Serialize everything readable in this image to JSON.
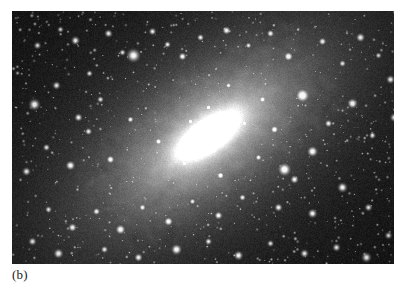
{
  "figure": {
    "caption_label": "(b)",
    "page_background": "#ffffff",
    "plate": {
      "x": 12,
      "y": 11,
      "width": 382,
      "height": 253,
      "background_color": "#0d0d0d",
      "sky_brightness": 22,
      "noise_amplitude": 16,
      "vignette": 0.18
    },
    "galaxy": {
      "name": "spiral-galaxy",
      "center_x": 196,
      "center_y": 124,
      "position_angle_deg": -35,
      "core": {
        "semi_major": 40,
        "semi_minor": 17,
        "peak_brightness": 255,
        "falloff": 2.0
      },
      "disk": {
        "semi_major": 132,
        "semi_minor": 62,
        "peak_brightness": 150,
        "falloff": 1.35
      },
      "halo": {
        "semi_major": 200,
        "semi_minor": 104,
        "peak_brightness": 74,
        "falloff": 1.0
      },
      "mottling_amplitude": 11
    },
    "star_field": {
      "faint_star_count": 900,
      "faint_brightness_range": [
        55,
        150
      ],
      "faint_radius_range": [
        0.6,
        1.5
      ],
      "bright_stars": [
        {
          "x": 25,
          "y": 34,
          "r": 2.2,
          "b": 205
        },
        {
          "x": 22,
          "y": 93,
          "r": 3.4,
          "b": 248
        },
        {
          "x": 48,
          "y": 18,
          "r": 1.9,
          "b": 195
        },
        {
          "x": 63,
          "y": 29,
          "r": 2.6,
          "b": 222
        },
        {
          "x": 77,
          "y": 62,
          "r": 2.0,
          "b": 200
        },
        {
          "x": 96,
          "y": 22,
          "r": 2.4,
          "b": 215
        },
        {
          "x": 110,
          "y": 41,
          "r": 2.0,
          "b": 198
        },
        {
          "x": 121,
          "y": 44,
          "r": 4.3,
          "b": 238
        },
        {
          "x": 140,
          "y": 20,
          "r": 2.3,
          "b": 212
        },
        {
          "x": 155,
          "y": 33,
          "r": 2.1,
          "b": 205
        },
        {
          "x": 170,
          "y": 45,
          "r": 2.5,
          "b": 228
        },
        {
          "x": 188,
          "y": 26,
          "r": 2.2,
          "b": 208
        },
        {
          "x": 214,
          "y": 19,
          "r": 2.6,
          "b": 224
        },
        {
          "x": 236,
          "y": 34,
          "r": 2.0,
          "b": 200
        },
        {
          "x": 258,
          "y": 22,
          "r": 2.4,
          "b": 216
        },
        {
          "x": 276,
          "y": 45,
          "r": 3.0,
          "b": 238
        },
        {
          "x": 290,
          "y": 84,
          "r": 4.6,
          "b": 255
        },
        {
          "x": 310,
          "y": 30,
          "r": 2.5,
          "b": 220
        },
        {
          "x": 330,
          "y": 52,
          "r": 2.2,
          "b": 206
        },
        {
          "x": 348,
          "y": 26,
          "r": 2.8,
          "b": 230
        },
        {
          "x": 366,
          "y": 44,
          "r": 2.0,
          "b": 198
        },
        {
          "x": 378,
          "y": 68,
          "r": 2.6,
          "b": 225
        },
        {
          "x": 340,
          "y": 92,
          "r": 3.2,
          "b": 242
        },
        {
          "x": 316,
          "y": 112,
          "r": 2.4,
          "b": 214
        },
        {
          "x": 360,
          "y": 124,
          "r": 2.1,
          "b": 202
        },
        {
          "x": 382,
          "y": 106,
          "r": 2.7,
          "b": 228
        },
        {
          "x": 300,
          "y": 140,
          "r": 3.4,
          "b": 244
        },
        {
          "x": 272,
          "y": 158,
          "r": 4.2,
          "b": 252
        },
        {
          "x": 282,
          "y": 168,
          "r": 2.6,
          "b": 222
        },
        {
          "x": 246,
          "y": 146,
          "r": 2.2,
          "b": 206
        },
        {
          "x": 330,
          "y": 176,
          "r": 3.0,
          "b": 238
        },
        {
          "x": 356,
          "y": 196,
          "r": 2.3,
          "b": 210
        },
        {
          "x": 300,
          "y": 202,
          "r": 2.8,
          "b": 232
        },
        {
          "x": 266,
          "y": 196,
          "r": 2.5,
          "b": 218
        },
        {
          "x": 230,
          "y": 186,
          "r": 2.2,
          "b": 205
        },
        {
          "x": 206,
          "y": 204,
          "r": 2.6,
          "b": 224
        },
        {
          "x": 180,
          "y": 190,
          "r": 2.1,
          "b": 200
        },
        {
          "x": 156,
          "y": 210,
          "r": 2.9,
          "b": 236
        },
        {
          "x": 130,
          "y": 196,
          "r": 2.3,
          "b": 210
        },
        {
          "x": 108,
          "y": 218,
          "r": 3.2,
          "b": 244
        },
        {
          "x": 84,
          "y": 200,
          "r": 2.4,
          "b": 214
        },
        {
          "x": 60,
          "y": 216,
          "r": 2.7,
          "b": 228
        },
        {
          "x": 36,
          "y": 198,
          "r": 2.2,
          "b": 204
        },
        {
          "x": 20,
          "y": 230,
          "r": 2.5,
          "b": 218
        },
        {
          "x": 46,
          "y": 242,
          "r": 3.0,
          "b": 238
        },
        {
          "x": 92,
          "y": 238,
          "r": 2.3,
          "b": 208
        },
        {
          "x": 126,
          "y": 246,
          "r": 2.6,
          "b": 222
        },
        {
          "x": 164,
          "y": 238,
          "r": 3.3,
          "b": 246
        },
        {
          "x": 196,
          "y": 230,
          "r": 2.2,
          "b": 206
        },
        {
          "x": 226,
          "y": 244,
          "r": 2.8,
          "b": 232
        },
        {
          "x": 258,
          "y": 232,
          "r": 2.1,
          "b": 200
        },
        {
          "x": 292,
          "y": 242,
          "r": 2.5,
          "b": 218
        },
        {
          "x": 324,
          "y": 236,
          "r": 2.4,
          "b": 212
        },
        {
          "x": 354,
          "y": 246,
          "r": 2.9,
          "b": 234
        },
        {
          "x": 376,
          "y": 224,
          "r": 2.2,
          "b": 204
        },
        {
          "x": 14,
          "y": 160,
          "r": 2.6,
          "b": 222
        },
        {
          "x": 34,
          "y": 136,
          "r": 2.2,
          "b": 206
        },
        {
          "x": 58,
          "y": 154,
          "r": 3.0,
          "b": 238
        },
        {
          "x": 76,
          "y": 120,
          "r": 2.3,
          "b": 208
        },
        {
          "x": 98,
          "y": 148,
          "r": 2.7,
          "b": 228
        },
        {
          "x": 44,
          "y": 74,
          "r": 2.4,
          "b": 214
        },
        {
          "x": 88,
          "y": 88,
          "r": 2.1,
          "b": 200
        },
        {
          "x": 66,
          "y": 106,
          "r": 2.5,
          "b": 218
        },
        {
          "x": 118,
          "y": 108,
          "r": 2.2,
          "b": 205
        },
        {
          "x": 146,
          "y": 130,
          "r": 2.4,
          "b": 216
        },
        {
          "x": 172,
          "y": 152,
          "r": 2.3,
          "b": 210
        },
        {
          "x": 208,
          "y": 164,
          "r": 2.6,
          "b": 224
        },
        {
          "x": 232,
          "y": 112,
          "r": 2.2,
          "b": 208
        },
        {
          "x": 250,
          "y": 88,
          "r": 2.4,
          "b": 214
        },
        {
          "x": 216,
          "y": 74,
          "r": 2.1,
          "b": 202
        },
        {
          "x": 262,
          "y": 118,
          "r": 2.7,
          "b": 230
        },
        {
          "x": 196,
          "y": 96,
          "r": 2.0,
          "b": 246
        },
        {
          "x": 178,
          "y": 110,
          "r": 1.9,
          "b": 244
        }
      ]
    }
  }
}
